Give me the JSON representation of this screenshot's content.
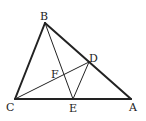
{
  "diagram": {
    "labels": {
      "A": "A",
      "B": "B",
      "C": "C",
      "D": "D",
      "E": "E",
      "F": "F"
    },
    "segments": [
      [
        "B",
        "C"
      ],
      [
        "B",
        "A"
      ],
      [
        "C",
        "A"
      ],
      [
        "B",
        "E"
      ],
      [
        "C",
        "D"
      ],
      [
        "D",
        "E"
      ]
    ],
    "line_color": "#222222"
  }
}
